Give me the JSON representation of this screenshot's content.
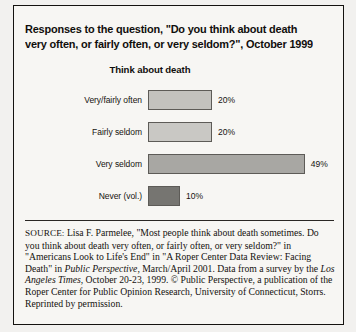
{
  "figure": {
    "title": "Responses to the question, \"Do you think about death very often, or fairly often, or very seldom?\", October 1999",
    "divider": "horizontal-rule"
  },
  "chart_data": {
    "type": "bar",
    "orientation": "horizontal",
    "title": "Think about death",
    "xlabel": "",
    "ylabel": "",
    "grid": false,
    "legend": false,
    "xlim": [
      0,
      50
    ],
    "categories": [
      "Very/fairly often",
      "Fairly seldom",
      "Very seldom",
      "Never (vol.)"
    ],
    "values": [
      20,
      20,
      49,
      10
    ],
    "value_labels": [
      "20%",
      "20%",
      "49%",
      "10%"
    ],
    "bar_colors": [
      "#c3c2be",
      "#c9c8c4",
      "#a8a7a3",
      "#767571"
    ]
  },
  "source_note": {
    "label": "SOURCE:",
    "part1": " Lisa F. Parmelee, \"Most people think about death sometimes. Do you think about death very often, or fairly often, or very seldom?\" in \"Americans Look to Life's End\" in \"A Roper Center Data Review: Facing Death\" in ",
    "italic1": "Public Perspective",
    "part2": ", March/April 2001. Data from a survey by the ",
    "italic2": "Los Angeles Times",
    "part3": ", October 20-23, 1999. © Public Perspective, a publication of the Roper Center for Public Opinion Research, University of Connecticut, Storrs. Reprinted by permission."
  }
}
